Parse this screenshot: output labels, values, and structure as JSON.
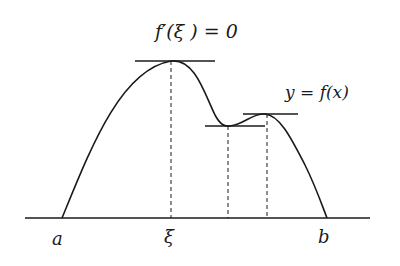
{
  "figure": {
    "type": "function-graph-diagram",
    "labels": {
      "tangent_condition": "f′(ξ ) = 0",
      "curve": "y = f(x)",
      "x_a": "a",
      "x_xi": "ξ",
      "x_b": "b"
    },
    "colors": {
      "stroke": "#1a1a1a",
      "background": "#ffffff"
    },
    "axis": {
      "y": 218,
      "x_start": 25,
      "x_end": 370
    },
    "points": {
      "a": [
        62,
        218
      ],
      "xi_peak": [
        171,
        61
      ],
      "local_min": [
        228,
        126
      ],
      "local_max": [
        267,
        114
      ],
      "b": [
        327,
        218
      ]
    },
    "tangents": [
      {
        "name": "tangent-at-xi",
        "y": 61,
        "x1": 135,
        "x2": 215
      },
      {
        "name": "tangent-at-local-min",
        "y": 126,
        "x1": 205,
        "x2": 265
      },
      {
        "name": "tangent-at-local-max",
        "y": 114,
        "x1": 243,
        "x2": 298
      }
    ],
    "dashed_lines": [
      {
        "name": "dashed-xi",
        "x": 171,
        "y1": 61,
        "y2": 218
      },
      {
        "name": "dashed-local-min",
        "x": 228,
        "y1": 126,
        "y2": 218
      },
      {
        "name": "dashed-local-max",
        "x": 267,
        "y1": 114,
        "y2": 218
      }
    ]
  }
}
